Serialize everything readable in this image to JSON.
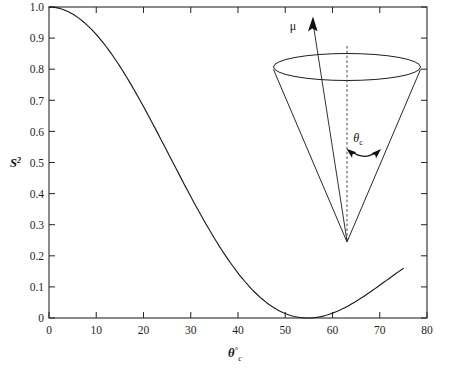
{
  "figure": {
    "background_color": "#ffffff",
    "ink_color": "#1c1c1c"
  },
  "chart_data": {
    "type": "line",
    "title": "",
    "subtitle": "",
    "xlabel": "θ°c",
    "xlabel_parts": {
      "symbol": "θ",
      "superscript": "°",
      "subscript": "c"
    },
    "ylabel": "S²",
    "ylabel_parts": {
      "symbol": "S",
      "superscript": "2"
    },
    "xlim": [
      0,
      80
    ],
    "ylim": [
      0,
      1.0
    ],
    "grid": false,
    "legend": null,
    "xticks": [
      0,
      10,
      20,
      30,
      40,
      50,
      60,
      70,
      80
    ],
    "xtick_labels": [
      "0",
      "10",
      "20",
      "30",
      "40",
      "50",
      "60",
      "70",
      "80"
    ],
    "yticks": [
      0,
      0.1,
      0.2,
      0.3,
      0.4,
      0.5,
      0.6,
      0.7,
      0.8,
      0.9,
      1.0
    ],
    "ytick_labels": [
      "0",
      "0.1",
      "0.2",
      "0.3",
      "0.4",
      "0.5",
      "0.6",
      "0.7",
      "0.8",
      "0.9",
      "1.0"
    ],
    "tick_direction": "in",
    "frame": [
      "left",
      "bottom",
      "top",
      "right"
    ],
    "series": [
      {
        "name": "S squared order parameter",
        "formula": "S^2 = [ (3 cos^2(theta) - 1) / 2 ]^2",
        "x": [
          0,
          2,
          4,
          6,
          8,
          10,
          12,
          14,
          16,
          18,
          20,
          22,
          24,
          26,
          28,
          30,
          32,
          34,
          36,
          38,
          40,
          42,
          44,
          46,
          48,
          50,
          52,
          54,
          56,
          58,
          60,
          62,
          64,
          66,
          68,
          70,
          72,
          74,
          75
        ],
        "y": [
          1.0,
          0.993,
          0.971,
          0.935,
          0.887,
          0.828,
          0.76,
          0.686,
          0.608,
          0.528,
          0.448,
          0.37,
          0.296,
          0.229,
          0.17,
          0.119,
          0.077,
          0.045,
          0.022,
          0.008,
          0.002,
          0.002,
          0.009,
          0.021,
          0.037,
          0.055,
          0.075,
          0.095,
          0.114,
          0.131,
          0.145,
          0.157,
          0.165,
          0.17,
          0.172,
          0.171,
          0.167,
          0.161,
          0.158
        ]
      }
    ],
    "drawn_curve_note": "Monotonic decreasing branch plotted from (0, 1.00) to approximately (75, 0.02)",
    "drawn_points": {
      "x": [
        0,
        5,
        10,
        15,
        20,
        25,
        30,
        35,
        40,
        45,
        50,
        55,
        60,
        65,
        70,
        75
      ],
      "y": [
        1.0,
        0.985,
        0.945,
        0.878,
        0.79,
        0.69,
        0.585,
        0.478,
        0.375,
        0.285,
        0.205,
        0.145,
        0.1,
        0.068,
        0.042,
        0.022
      ]
    }
  },
  "inset": {
    "name": "cone-diagram",
    "description": "Cone of motion with apex at bottom, circular top rim, dashed symmetry axis, magnetic moment vector and cone half-angle",
    "vector_label": "μ",
    "angle_label": "θc",
    "angle_label_parts": {
      "symbol": "θ",
      "subscript": "c"
    },
    "axis_style": "dashed",
    "arrow_style": "double-headed-arc"
  }
}
